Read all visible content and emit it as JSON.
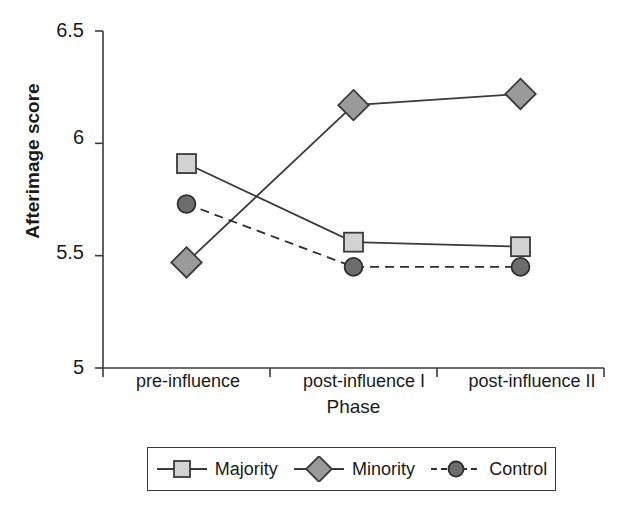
{
  "chart_data": {
    "type": "line",
    "title": "",
    "xlabel": "Phase",
    "ylabel": "Afterimage score",
    "categories": [
      "pre-influence",
      "post-influence I",
      "post-influence II"
    ],
    "ylim": [
      5,
      6.5
    ],
    "yticks": [
      5,
      5.5,
      6,
      6.5
    ],
    "ytick_labels": [
      "5",
      "5.5",
      "6",
      "6.5"
    ],
    "grid": false,
    "legend_position": "bottom",
    "series": [
      {
        "name": "Majority",
        "values": [
          5.91,
          5.56,
          5.54
        ],
        "marker": "square",
        "linestyle": "solid",
        "marker_fill": "#d2d2d2",
        "marker_edge": "#3a3a3a",
        "line_color": "#3a3a3a"
      },
      {
        "name": "Minority",
        "values": [
          5.47,
          6.17,
          6.22
        ],
        "marker": "diamond",
        "linestyle": "solid",
        "marker_fill": "#9a9a9a",
        "marker_edge": "#3a3a3a",
        "line_color": "#3a3a3a"
      },
      {
        "name": "Control",
        "values": [
          5.73,
          5.45,
          5.45
        ],
        "marker": "circle",
        "linestyle": "dashed",
        "marker_fill": "#6d6d6d",
        "marker_edge": "#2e2e2e",
        "line_color": "#2e2e2e"
      }
    ]
  },
  "axes": {
    "y_title": "Afterimage score",
    "x_title": "Phase",
    "y_tick_0": "5",
    "y_tick_1": "5.5",
    "y_tick_2": "6",
    "y_tick_3": "6.5",
    "x_tick_0": "pre-influence",
    "x_tick_1": "post-influence I",
    "x_tick_2": "post-influence II"
  },
  "legend": {
    "items": [
      {
        "label": "Majority",
        "marker": "square-marker-icon"
      },
      {
        "label": "Minority",
        "marker": "diamond-marker-icon"
      },
      {
        "label": "Control",
        "marker": "circle-marker-icon"
      }
    ]
  }
}
